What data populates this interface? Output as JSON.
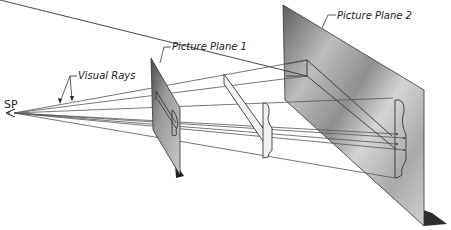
{
  "labels": {
    "station_point": "SP",
    "visual_rays": "Visual Rays",
    "picture_plane_1": "Picture Plane 1",
    "picture_plane_2": "Picture Plane 2"
  },
  "colors": {
    "background": "#ffffff",
    "line": "#333333",
    "ray": "#555555",
    "plane_dark": "#6e6e6e",
    "plane_light": "#d8d8d8",
    "shadow": "#2a2a2a"
  },
  "elements": {
    "station_point": {
      "x": 14,
      "y": 113
    },
    "picture_plane_1": {
      "type": "parallelogram",
      "note": "small plane near SP"
    },
    "object": {
      "type": "projected object between planes"
    },
    "picture_plane_2": {
      "type": "parallelogram",
      "note": "large plane on right"
    }
  }
}
